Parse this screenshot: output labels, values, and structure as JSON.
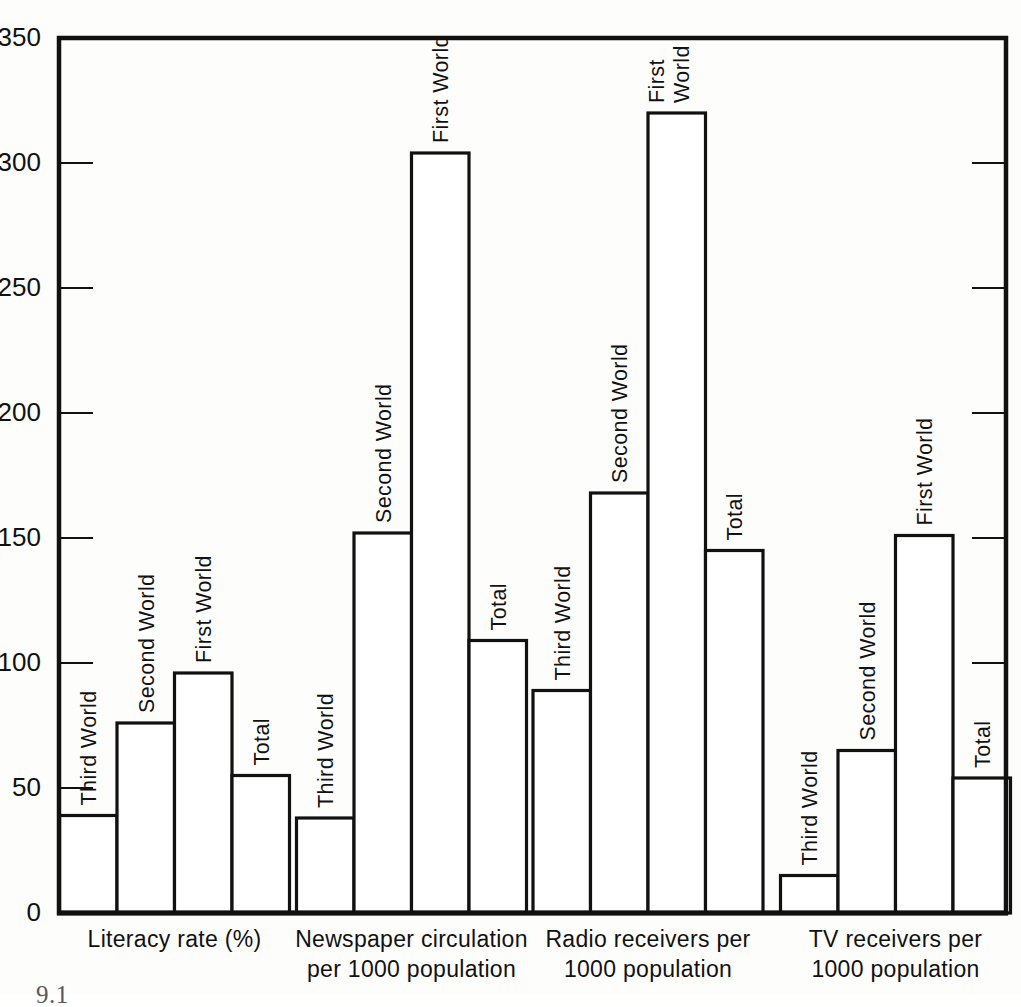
{
  "figure": {
    "caption_partial": "9.1",
    "background_color": "#fdfdfc",
    "line_color": "#111111"
  },
  "chart_data": {
    "type": "bar",
    "title": "",
    "subtitle": "",
    "xlabel": "",
    "ylabel": "",
    "ylim": [
      0,
      350
    ],
    "ytick_labels": [
      "0",
      "50",
      "100",
      "150",
      "200",
      "250",
      "300",
      "350"
    ],
    "ytick_values": [
      0,
      50,
      100,
      150,
      200,
      250,
      300,
      350
    ],
    "grid": false,
    "legend_position": "none",
    "bar_style": "outlined-white",
    "categories": [
      "Third World",
      "Second World",
      "First World",
      "Total"
    ],
    "groups": [
      {
        "label_lines": [
          "Literacy rate  (%)"
        ],
        "label": "Literacy rate  (%)",
        "bars": [
          {
            "name": "Third World",
            "value": 39,
            "label_lines": [
              "Third World"
            ]
          },
          {
            "name": "Second World",
            "value": 76,
            "label_lines": [
              "Second World"
            ]
          },
          {
            "name": "First World",
            "value": 96,
            "label_lines": [
              "First World"
            ]
          },
          {
            "name": "Total",
            "value": 55,
            "label_lines": [
              "Total"
            ]
          }
        ]
      },
      {
        "label_lines": [
          "Newspaper circulation",
          "per 1000 population"
        ],
        "label": "Newspaper circulation per 1000 population",
        "bars": [
          {
            "name": "Third World",
            "value": 38,
            "label_lines": [
              "Third World"
            ]
          },
          {
            "name": "Second World",
            "value": 152,
            "label_lines": [
              "Second World"
            ]
          },
          {
            "name": "First World",
            "value": 304,
            "label_lines": [
              "First World"
            ]
          },
          {
            "name": "Total",
            "value": 109,
            "label_lines": [
              "Total"
            ]
          }
        ]
      },
      {
        "label_lines": [
          "Radio receivers per",
          "1000 population"
        ],
        "label": "Radio receivers per 1000 population",
        "bars": [
          {
            "name": "Third World",
            "value": 89,
            "label_lines": [
              "Third World"
            ]
          },
          {
            "name": "Second World",
            "value": 168,
            "label_lines": [
              "Second World"
            ]
          },
          {
            "name": "First World",
            "value": 320,
            "label_lines": [
              "First",
              "World"
            ]
          },
          {
            "name": "Total",
            "value": 145,
            "label_lines": [
              "Total"
            ]
          }
        ]
      },
      {
        "label_lines": [
          "TV receivers per",
          "1000 population"
        ],
        "label": "TV receivers per 1000 population",
        "bars": [
          {
            "name": "Third World",
            "value": 15,
            "label_lines": [
              "Third World"
            ]
          },
          {
            "name": "Second World",
            "value": 65,
            "label_lines": [
              "Second World"
            ]
          },
          {
            "name": "First World",
            "value": 151,
            "label_lines": [
              "First World"
            ]
          },
          {
            "name": "Total",
            "value": 54,
            "label_lines": [
              "Total"
            ]
          }
        ]
      }
    ]
  }
}
